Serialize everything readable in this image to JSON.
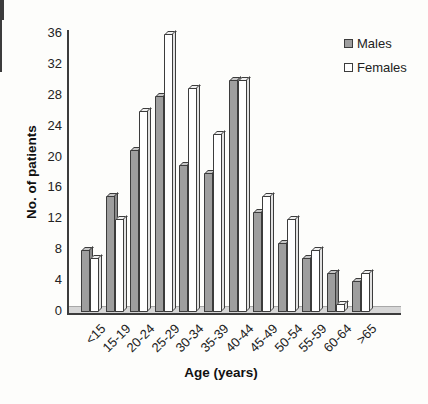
{
  "figure": {
    "background": "#fdfdfb"
  },
  "chart_data": {
    "type": "bar",
    "style": "3d-oblique-clustered",
    "title": "",
    "xlabel": "Age (years)",
    "ylabel": "No. of patients",
    "categories": [
      "<15",
      "15-19",
      "20-24",
      "25-29",
      "30-34",
      "35-39",
      "40-44",
      "45-49",
      "50-54",
      "55-59",
      "60-64",
      ">65"
    ],
    "series": [
      {
        "name": "Males",
        "values": [
          8,
          15,
          21,
          28,
          19,
          18,
          30,
          13,
          9,
          7,
          5,
          4
        ],
        "colors": {
          "front": "#9e9e9e",
          "top": "#c6c6c6",
          "side": "#8a8a8a"
        }
      },
      {
        "name": "Females",
        "values": [
          7,
          12,
          26,
          36,
          29,
          23,
          30,
          15,
          12,
          8,
          1,
          5
        ],
        "colors": {
          "front": "#ffffff",
          "top": "#f0f0f0",
          "side": "#e2e2e2"
        }
      }
    ],
    "ylim": [
      0,
      36
    ],
    "yticks": [
      0,
      4,
      8,
      12,
      16,
      20,
      24,
      28,
      32,
      36
    ],
    "grid": false,
    "legend_position": "top-right",
    "axis_color": "#3c3c3c",
    "outline_color": "#3c3c3c",
    "floor_color": "#d6d6d6"
  }
}
